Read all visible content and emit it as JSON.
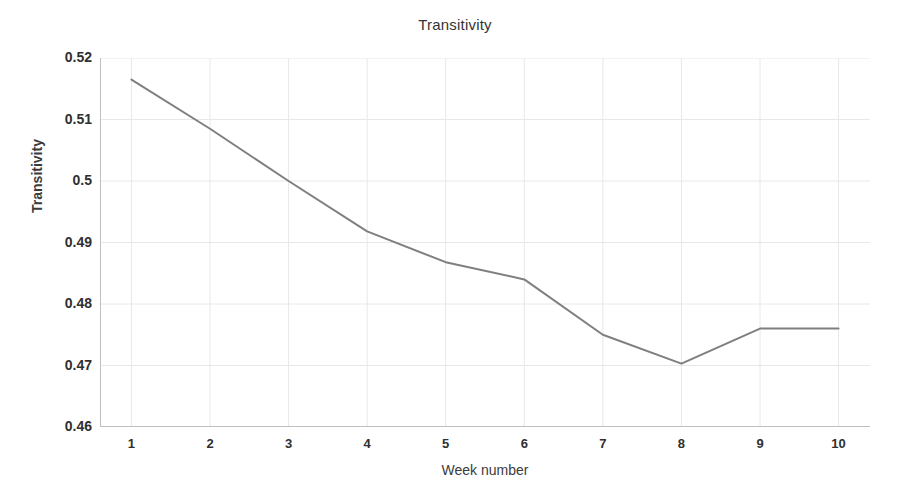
{
  "chart_data": {
    "type": "line",
    "title": "Transitivity",
    "xlabel": "Week number",
    "ylabel": "Transitivity",
    "x": [
      1,
      2,
      3,
      4,
      5,
      6,
      7,
      8,
      9,
      10
    ],
    "categories": [
      "1",
      "2",
      "3",
      "4",
      "5",
      "6",
      "7",
      "8",
      "9",
      "10"
    ],
    "values": [
      0.5165,
      0.5085,
      0.5,
      0.4918,
      0.4868,
      0.484,
      0.475,
      0.4703,
      0.476,
      0.476
    ],
    "series": [
      {
        "name": "Transitivity",
        "color": "#7f7f7f",
        "values": [
          0.5165,
          0.5085,
          0.5,
          0.4918,
          0.4868,
          0.484,
          0.475,
          0.4703,
          0.476,
          0.476
        ]
      }
    ],
    "xlim": [
      0.6,
      10.4
    ],
    "ylim": [
      0.46,
      0.52
    ],
    "xticks": [
      1,
      2,
      3,
      4,
      5,
      6,
      7,
      8,
      9,
      10
    ],
    "xtick_labels": [
      "1",
      "2",
      "3",
      "4",
      "5",
      "6",
      "7",
      "8",
      "9",
      "10"
    ],
    "yticks": [
      0.46,
      0.47,
      0.48,
      0.49,
      0.5,
      0.51,
      0.52
    ],
    "ytick_labels": [
      "0.46",
      "0.47",
      "0.48",
      "0.49",
      "0.5",
      "0.51",
      "0.52"
    ],
    "grid": true,
    "grid_color": "#e8e8e8",
    "axis_color": "#bfbfbf",
    "legend": false,
    "legend_position": "none",
    "background": "#ffffff",
    "line_width": 2,
    "markers": false
  }
}
